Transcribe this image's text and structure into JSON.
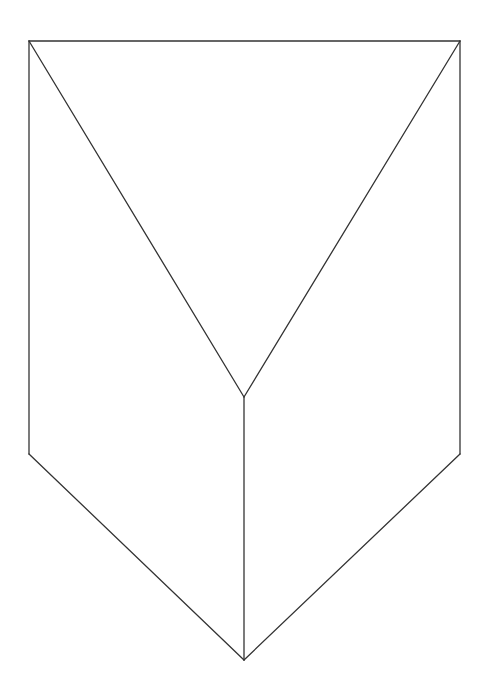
{
  "figure": {
    "stroke_color": "#333333",
    "background": "#ffffff",
    "vertices": {
      "top_left": [
        29,
        41
      ],
      "top_right": [
        460,
        41
      ],
      "center": [
        244,
        397
      ],
      "bottom": [
        244,
        660
      ],
      "left_bottom": [
        29,
        454
      ],
      "right_bottom": [
        460,
        454
      ]
    }
  }
}
